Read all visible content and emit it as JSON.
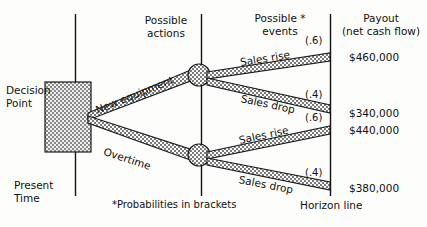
{
  "diagram": {
    "type": "decision-tree",
    "columns": [
      {
        "id": "possible-actions",
        "label": "Possible\nactions"
      },
      {
        "id": "possible-events",
        "label": "Possible *\nevents"
      },
      {
        "id": "payout",
        "label": "Payout\n(net cash flow)"
      }
    ],
    "decision_point_label": "Decision\nPoint",
    "present_time_label": "Present\nTime",
    "horizon_line_label": "Horizon line",
    "footnote": "*Probabilities in brackets",
    "actions": [
      {
        "id": "new-equipment",
        "label": "New equipment",
        "events": [
          {
            "id": "new-equipment-sales-rise",
            "label": "Sales rise",
            "probability": "(.6)",
            "payout": "$460,000"
          },
          {
            "id": "new-equipment-sales-drop",
            "label": "Sales drop",
            "probability": "(.4)",
            "payout": "$340,000"
          }
        ]
      },
      {
        "id": "overtime",
        "label": "Overtime",
        "events": [
          {
            "id": "overtime-sales-rise",
            "label": "Sales rise",
            "probability": "(.6)",
            "payout": "$440,000"
          },
          {
            "id": "overtime-sales-drop",
            "label": "Sales drop",
            "probability": "(.4)",
            "payout": "$380,000"
          }
        ]
      }
    ],
    "colors": {
      "ink": "#111111",
      "branch_fill": "#8d8d8d",
      "branch_stroke": "#1a1a1a",
      "node_fill": "#8d8d8d",
      "box_fill": "#9a9a9a",
      "background": "#fdfdfb"
    }
  }
}
